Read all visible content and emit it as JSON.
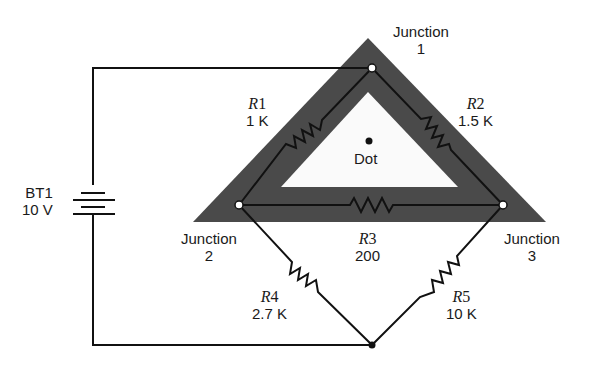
{
  "diagram": {
    "type": "circuit-schematic",
    "colors": {
      "wire": "#111111",
      "highlight_band": "#4a4a4a",
      "inner_fill": "#fafafa",
      "background": "#ffffff",
      "node_fill": "#ffffff"
    },
    "battery": {
      "name": "BT1",
      "value": "10 V"
    },
    "resistors": [
      {
        "id": "R1",
        "letter": "R",
        "num": "1",
        "value": "1 K",
        "from": "Junction 1",
        "to": "Junction 2"
      },
      {
        "id": "R2",
        "letter": "R",
        "num": "2",
        "value": "1.5 K",
        "from": "Junction 1",
        "to": "Junction 3"
      },
      {
        "id": "R3",
        "letter": "R",
        "num": "3",
        "value": "200",
        "from": "Junction 2",
        "to": "Junction 3"
      },
      {
        "id": "R4",
        "letter": "R",
        "num": "4",
        "value": "2.7 K",
        "from": "Junction 2",
        "to": "Bottom node"
      },
      {
        "id": "R5",
        "letter": "R",
        "num": "5",
        "value": "10 K",
        "from": "Junction 3",
        "to": "Bottom node"
      }
    ],
    "junctions": [
      {
        "title": "Junction",
        "num": "1"
      },
      {
        "title": "Junction",
        "num": "2"
      },
      {
        "title": "Junction",
        "num": "3"
      }
    ],
    "dot_label": "Dot"
  }
}
